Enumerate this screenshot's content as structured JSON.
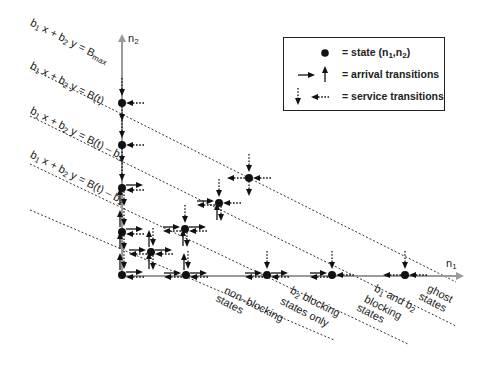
{
  "figure": {
    "type": "state-transition-diagram",
    "axes": {
      "horizontal": {
        "label": "n",
        "label_sub": "1"
      },
      "vertical": {
        "label": "n",
        "label_sub": "2"
      }
    },
    "boundary_lines": [
      {
        "id": "bmax",
        "equation_prefix": "b",
        "eq_part1_sub": "1",
        "eq_part2": " x + b",
        "eq_part2_sub": "2",
        "eq_part3": " y = B",
        "eq_part3_sub": "max"
      },
      {
        "id": "bt",
        "equation_prefix": "b",
        "eq_part1_sub": "1",
        "eq_part2": " x + b",
        "eq_part2_sub": "2",
        "eq_part3": " y = B(t)",
        "eq_part3_sub": ""
      },
      {
        "id": "bt-b1",
        "equation_prefix": "b",
        "eq_part1_sub": "1",
        "eq_part2": " x + b",
        "eq_part2_sub": "2",
        "eq_part3": " y = B(t) – b",
        "eq_part3_sub": "1"
      },
      {
        "id": "bt-b2",
        "equation_prefix": "b",
        "eq_part1_sub": "1",
        "eq_part2": " x + b",
        "eq_part2_sub": "2",
        "eq_part3": " y = B(t) – b",
        "eq_part3_sub": "2"
      }
    ],
    "regions": [
      {
        "id": "non-blocking",
        "line1": "non–blocking",
        "line2": "states",
        "line3": ""
      },
      {
        "id": "b2-blocking",
        "line1_prefix": "b",
        "line1_sub": "2",
        "line1_suffix": " blocking",
        "line2": "states only",
        "line3": ""
      },
      {
        "id": "b1-b2-blocking",
        "line1_prefix": "b",
        "line1_sub": "1",
        "line1_mid": " and b",
        "line1_sub2": "2",
        "line2": "blocking",
        "line3": "states"
      },
      {
        "id": "ghost",
        "line1": "ghost",
        "line2": "states",
        "line3": ""
      }
    ],
    "legend": {
      "items": [
        {
          "symbol": "filled-circle",
          "text": "= state (n",
          "sub1": "1",
          "mid": ",n",
          "sub2": "2",
          "end": ")"
        },
        {
          "symbol": "solid-arrows",
          "text": "= arrival transitions"
        },
        {
          "symbol": "dotted-arrows",
          "text": "= service transitions"
        }
      ]
    },
    "states": [
      {
        "n1": 0,
        "n2": 4,
        "region": "b1-b2-blocking"
      },
      {
        "n1": 0,
        "n2": 3,
        "region": "b1-b2-blocking"
      },
      {
        "n1": 0,
        "n2": 2,
        "region": "b2-blocking"
      },
      {
        "n1": 0,
        "n2": 1,
        "region": "non-blocking"
      },
      {
        "n1": 0,
        "n2": 0,
        "region": "non-blocking"
      },
      {
        "n1": 1,
        "n2": 1,
        "region": "non-blocking"
      },
      {
        "n1": 2,
        "n2": 2,
        "region": "non-blocking"
      },
      {
        "n1": 3,
        "n2": 3,
        "region": "b2-blocking"
      },
      {
        "n1": 4,
        "n2": 4,
        "region": "ghost"
      },
      {
        "n1": 1,
        "n2": 0,
        "region": "non-blocking"
      },
      {
        "n1": 2,
        "n2": 0,
        "region": "b2-blocking"
      },
      {
        "n1": 3,
        "n2": 0,
        "region": "b1-b2-blocking"
      },
      {
        "n1": 4,
        "n2": 0,
        "region": "ghost"
      }
    ],
    "colors": {
      "ink": "#111111",
      "axis": "#9a9a9a",
      "dotted": "#333333"
    }
  }
}
